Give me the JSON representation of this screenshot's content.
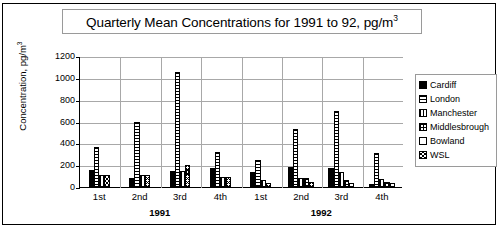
{
  "chart_data": {
    "type": "bar",
    "title": "Quarterly Mean Concentrations for 1991 to 92, pg/m",
    "title_superscript": "3",
    "xlabel": "",
    "ylabel": "Concentration, pg/m",
    "ylabel_superscript": "3",
    "ylim": [
      0,
      1200
    ],
    "ytick_values": [
      1200,
      1000,
      800,
      600,
      400,
      200,
      0
    ],
    "ytick_labels": [
      "1200",
      "1000",
      "800",
      "600",
      "400",
      "200",
      "0"
    ],
    "grid": true,
    "legend_position": "right",
    "categories": [
      "1st",
      "2nd",
      "3rd",
      "4th",
      "1st",
      "2nd",
      "3rd",
      "4th"
    ],
    "group_labels": [
      "1991",
      "1992"
    ],
    "group_spans": [
      4,
      4
    ],
    "series": [
      {
        "name": "Cardiff",
        "pattern": "solid-black",
        "values": [
          155,
          85,
          150,
          170,
          140,
          185,
          170,
          30
        ]
      },
      {
        "name": "London",
        "pattern": "horizontal-lines",
        "values": [
          370,
          595,
          1050,
          325,
          250,
          530,
          700,
          310
        ]
      },
      {
        "name": "Manchester",
        "pattern": "vertical-lines",
        "values": [
          110,
          110,
          145,
          95,
          65,
          80,
          140,
          75
        ]
      },
      {
        "name": "Middlesbrough",
        "pattern": "grid-hatch",
        "values": [
          0,
          0,
          0,
          0,
          0,
          85,
          65,
          50
        ]
      },
      {
        "name": "Bowland",
        "pattern": "white-empty",
        "values": [
          0,
          0,
          0,
          0,
          0,
          0,
          40,
          40
        ]
      },
      {
        "name": "WSL",
        "pattern": "dense-crosshatch",
        "values": [
          110,
          110,
          205,
          90,
          35,
          50,
          0,
          0
        ]
      }
    ]
  },
  "legend": {
    "items": [
      {
        "label": "Cardiff",
        "swatch": "solid-black-swatch"
      },
      {
        "label": "London",
        "swatch": "horizontal-lines-swatch"
      },
      {
        "label": "Manchester",
        "swatch": "vertical-lines-swatch"
      },
      {
        "label": "Middlesbrough",
        "swatch": "grid-hatch-swatch"
      },
      {
        "label": "Bowland",
        "swatch": "white-empty-swatch"
      },
      {
        "label": "WSL",
        "swatch": "dense-crosshatch-swatch"
      }
    ]
  }
}
